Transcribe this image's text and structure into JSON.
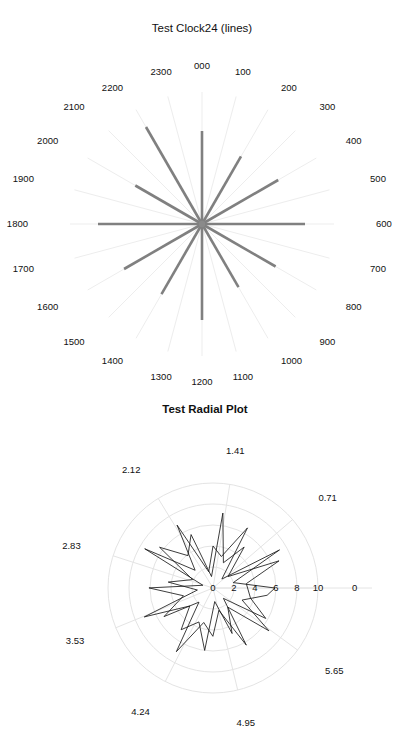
{
  "page": {
    "background": "#ffffff",
    "width": 399,
    "height": 745
  },
  "colors": {
    "spoke_major": "#808080",
    "spoke_grid": "#ededed",
    "radial_grid": "#e4e4e4",
    "series_line": "#1a1a1a",
    "text": "#111111"
  },
  "clock_panel": {
    "title": "Test Clock24 (lines)",
    "center": {
      "x": 202,
      "y": 224
    },
    "label_radius": 158,
    "grid_radius": 132,
    "hour_labels": [
      "000",
      "100",
      "200",
      "300",
      "400",
      "500",
      "600",
      "700",
      "800",
      "900",
      "1000",
      "1100",
      "1200",
      "1300",
      "1400",
      "1500",
      "1600",
      "1700",
      "1800",
      "1900",
      "2000",
      "2100",
      "2200",
      "2300"
    ],
    "chart_data": {
      "type": "line",
      "title": "Test Clock24 (lines)",
      "xlabel": "",
      "ylabel": "",
      "grid": true,
      "legend": "none",
      "categories": [
        "000",
        "100",
        "200",
        "300",
        "400",
        "500",
        "600",
        "700",
        "800",
        "900",
        "1000",
        "1100",
        "1200",
        "1300",
        "1400",
        "1500",
        "1600",
        "1700",
        "1800",
        "1900",
        "2000",
        "2100",
        "2200",
        "2300"
      ],
      "angles_deg": [
        0,
        15,
        30,
        45,
        60,
        75,
        90,
        105,
        120,
        135,
        150,
        165,
        180,
        195,
        210,
        225,
        240,
        255,
        270,
        285,
        300,
        315,
        330,
        345
      ],
      "series": [
        {
          "name": "hour-ray-length",
          "values": [
            93,
            0,
            78,
            0,
            88,
            0,
            103,
            0,
            85,
            0,
            73,
            0,
            96,
            0,
            81,
            0,
            90,
            0,
            104,
            0,
            77,
            0,
            112,
            0
          ]
        }
      ],
      "ylim": [
        0,
        132
      ],
      "note": "Thick grey rays drawn at even hours (000,200,400,...,2200); faint radial gridlines at all 24 hours."
    }
  },
  "radial_panel": {
    "title": "Test Radial Plot",
    "center": {
      "x": 213,
      "y": 588
    },
    "outer_radius": 105,
    "angular_labels": [
      "0",
      "0.71",
      "1.41",
      "2.12",
      "2.83",
      "3.53",
      "4.24",
      "4.95",
      "5.65"
    ],
    "radial_tick_labels": [
      "0",
      "2",
      "4",
      "6",
      "8",
      "10"
    ],
    "chart_data": {
      "type": "line",
      "title": "Test Radial Plot",
      "xlabel": "",
      "ylabel": "",
      "grid": true,
      "legend": "none",
      "angular_unit": "radians",
      "angular_tick_labels": [
        "0",
        "0.71",
        "1.41",
        "2.12",
        "2.83",
        "3.53",
        "4.24",
        "4.95",
        "5.65"
      ],
      "angular_ticks": [
        0,
        0.71,
        1.41,
        2.12,
        2.83,
        3.53,
        4.24,
        4.95,
        5.65
      ],
      "radial_ticks": [
        0,
        2,
        4,
        6,
        8,
        10
      ],
      "rlim": [
        0,
        10
      ],
      "series": [
        {
          "name": "random-walk",
          "theta": [
            0.0,
            0.26,
            0.52,
            0.79,
            1.05,
            1.31,
            1.57,
            1.83,
            2.09,
            2.36,
            2.62,
            2.88,
            3.14,
            3.4,
            3.67,
            3.93,
            4.19,
            4.45,
            4.71,
            4.97,
            5.24,
            5.5,
            5.76,
            6.02,
            0.13,
            0.39,
            0.65,
            0.92,
            1.18,
            1.44,
            1.7,
            1.96,
            2.23,
            2.49,
            2.75,
            3.01,
            3.27,
            3.54,
            3.8,
            4.06,
            4.32,
            4.58,
            4.84,
            5.11,
            5.37,
            5.63,
            5.89,
            6.15
          ],
          "r": [
            5.9,
            2.0,
            7.3,
            1.2,
            6.6,
            3.1,
            4.0,
            1.6,
            6.9,
            2.4,
            7.5,
            1.0,
            6.1,
            2.9,
            5.4,
            1.9,
            7.0,
            3.4,
            4.6,
            2.2,
            6.3,
            1.4,
            5.8,
            3.7,
            3.2,
            6.8,
            1.8,
            4.9,
            2.6,
            7.2,
            1.1,
            5.5,
            3.9,
            6.4,
            2.1,
            4.3,
            1.5,
            7.1,
            2.8,
            5.0,
            3.5,
            6.0,
            1.3,
            4.7,
            2.3,
            6.7,
            3.0,
            5.2
          ]
        }
      ],
      "note": "Closed jagged polyline of ~48 pseudo-random radial points, black thin stroke, on faint polar grid."
    }
  }
}
